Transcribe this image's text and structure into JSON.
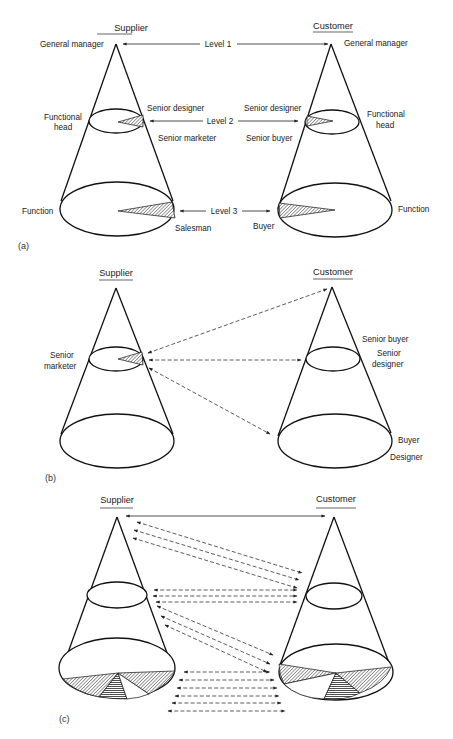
{
  "figure": {
    "panels": [
      {
        "id": "a",
        "tag": "(a)",
        "supplier": {
          "title": "Supplier",
          "apex_label": "General manager",
          "mid_label_line1": "Functional",
          "mid_label_line2": "head",
          "base_label": "Function",
          "mid_role_top": "Senior designer",
          "mid_role_bottom": "Senior marketer",
          "base_role": "Salesman"
        },
        "customer": {
          "title": "Customer",
          "apex_label": "General manager",
          "mid_label_line1": "Functional",
          "mid_label_line2": "head",
          "base_label": "Function",
          "mid_role_top": "Senior designer",
          "mid_role_bottom": "Senior buyer",
          "base_role": "Buyer"
        },
        "levels": [
          "Level 1",
          "Level 2",
          "Level 3"
        ]
      },
      {
        "id": "b",
        "tag": "(b)",
        "supplier": {
          "title": "Supplier",
          "mid_label_line1": "Senior",
          "mid_label_line2": "marketer"
        },
        "customer": {
          "title": "Customer",
          "mid_role_1": "Senior buyer",
          "mid_role_2a": "Senior",
          "mid_role_2b": "designer",
          "base_role_1": "Buyer",
          "base_role_2": "Designer"
        }
      },
      {
        "id": "c",
        "tag": "(c)",
        "supplier": {
          "title": "Supplier"
        },
        "customer": {
          "title": "Customer"
        }
      }
    ]
  }
}
